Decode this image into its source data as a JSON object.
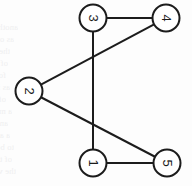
{
  "figure": {
    "background_color": "#fdfdfd",
    "stroke_color": "#1c1c1c",
    "node_fill_color": "#ffffff",
    "label_color": "#1c1c1c",
    "label_rotation_degrees": 90,
    "stroke_width": 2,
    "node_radius": 13.5,
    "width": 192,
    "height": 186
  },
  "chart_data": {
    "type": "diagram",
    "graph_type": "undirected",
    "title": "",
    "node_count": 5,
    "edge_count": 5,
    "nodes": [
      {
        "id": "3",
        "label": "3",
        "x": 93,
        "y": 18
      },
      {
        "id": "4",
        "label": "4",
        "x": 166,
        "y": 18
      },
      {
        "id": "2",
        "label": "2",
        "x": 29,
        "y": 91
      },
      {
        "id": "1",
        "label": "1",
        "x": 93,
        "y": 163
      },
      {
        "id": "5",
        "label": "5",
        "x": 167,
        "y": 163
      }
    ],
    "edges": [
      {
        "source": "3",
        "target": "4",
        "x1": 93,
        "y1": 18,
        "x2": 166,
        "y2": 18
      },
      {
        "source": "3",
        "target": "1",
        "x1": 93,
        "y1": 18,
        "x2": 93,
        "y2": 163
      },
      {
        "source": "2",
        "target": "4",
        "x1": 29,
        "y1": 91,
        "x2": 166,
        "y2": 18
      },
      {
        "source": "2",
        "target": "5",
        "x1": 29,
        "y1": 91,
        "x2": 167,
        "y2": 163
      },
      {
        "source": "1",
        "target": "5",
        "x1": 93,
        "y1": 163,
        "x2": 167,
        "y2": 163
      }
    ],
    "adjacency": {
      "1": [
        "3",
        "5"
      ],
      "2": [
        "4",
        "5"
      ],
      "3": [
        "4",
        "1"
      ],
      "4": [
        "3",
        "2"
      ],
      "5": [
        "2",
        "1"
      ]
    }
  },
  "watermark": {
    "description": "faint mirrored bleed-through text from reverse of scanned page",
    "color": "#efeff0",
    "lines": [
      {
        "text": "another  of  the",
        "x": 18,
        "y": 22
      },
      {
        "text": "as one of the most",
        "x": 14,
        "y": 34
      },
      {
        "text": "the connection of the",
        "x": 10,
        "y": 46
      },
      {
        "text": "of regular graph and",
        "x": 8,
        "y": 58
      },
      {
        "text": "for a summary of what the",
        "x": 6,
        "y": 70
      },
      {
        "text": "as in such a finite graph",
        "x": 10,
        "y": 82
      },
      {
        "text": "of which a theory of part of",
        "x": 6,
        "y": 94
      },
      {
        "text": "a minimal for each set",
        "x": 12,
        "y": 106
      },
      {
        "text": "and it appears in all cases",
        "x": 8,
        "y": 118
      },
      {
        "text": "a and if a graph has no",
        "x": 10,
        "y": 130
      },
      {
        "text": "to be defined for the",
        "x": 14,
        "y": 142
      },
      {
        "text": "of the graph in question",
        "x": 12,
        "y": 154
      },
      {
        "text": "the vertices and edges",
        "x": 16,
        "y": 166
      }
    ]
  }
}
